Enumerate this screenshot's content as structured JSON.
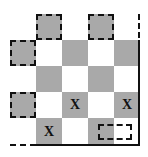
{
  "board": {
    "colors": {
      "dark": "#a9a9a9",
      "light": "#ffffff",
      "line": "#111111"
    },
    "cells": [
      {
        "x": 36,
        "y": 14,
        "color": "dark",
        "dashed": true,
        "mark": ""
      },
      {
        "x": 88,
        "y": 14,
        "color": "dark",
        "dashed": true,
        "mark": ""
      },
      {
        "x": 10,
        "y": 40,
        "color": "dark",
        "dashed": true,
        "mark": ""
      },
      {
        "x": 36,
        "y": 40,
        "color": "light",
        "dashed": false,
        "mark": ""
      },
      {
        "x": 62,
        "y": 40,
        "color": "dark",
        "dashed": false,
        "mark": ""
      },
      {
        "x": 88,
        "y": 40,
        "color": "light",
        "dashed": false,
        "mark": ""
      },
      {
        "x": 114,
        "y": 40,
        "color": "dark",
        "dashed": false,
        "mark": ""
      },
      {
        "x": 36,
        "y": 66,
        "color": "dark",
        "dashed": false,
        "mark": ""
      },
      {
        "x": 62,
        "y": 66,
        "color": "light",
        "dashed": false,
        "mark": ""
      },
      {
        "x": 88,
        "y": 66,
        "color": "dark",
        "dashed": false,
        "mark": ""
      },
      {
        "x": 114,
        "y": 66,
        "color": "light",
        "dashed": false,
        "mark": ""
      },
      {
        "x": 10,
        "y": 92,
        "color": "dark",
        "dashed": true,
        "mark": ""
      },
      {
        "x": 36,
        "y": 92,
        "color": "light",
        "dashed": false,
        "mark": ""
      },
      {
        "x": 62,
        "y": 92,
        "color": "dark",
        "dashed": false,
        "mark": "X"
      },
      {
        "x": 88,
        "y": 92,
        "color": "light",
        "dashed": false,
        "mark": ""
      },
      {
        "x": 114,
        "y": 92,
        "color": "dark",
        "dashed": false,
        "mark": "X"
      },
      {
        "x": 36,
        "y": 118,
        "color": "dark",
        "dashed": false,
        "mark": "X"
      },
      {
        "x": 62,
        "y": 118,
        "color": "light",
        "dashed": false,
        "mark": ""
      },
      {
        "x": 88,
        "y": 118,
        "color": "dark",
        "dashed": false,
        "mark": ""
      },
      {
        "x": 114,
        "y": 118,
        "color": "light",
        "dashed": false,
        "mark": ""
      }
    ],
    "marks": {
      "m1": "X",
      "m2": "X",
      "m3": "X"
    }
  }
}
